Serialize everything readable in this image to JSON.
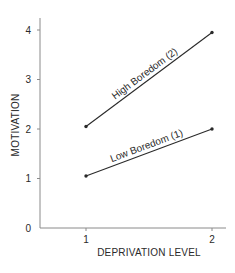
{
  "chart_data": {
    "type": "line",
    "title": "",
    "xlabel": "DEPRIVATION LEVEL",
    "ylabel": "MOTIVATION",
    "x": [
      1,
      2
    ],
    "x_ticks": [
      "1",
      "2"
    ],
    "y_ticks": [
      "0",
      "1",
      "2",
      "3",
      "4"
    ],
    "ylim": [
      0,
      4.2
    ],
    "grid": false,
    "legend": "inline labels along lines",
    "series": [
      {
        "name": "High Boredom (2)",
        "values": [
          2.05,
          3.95
        ]
      },
      {
        "name": "Low Boredom (1)",
        "values": [
          1.05,
          2.0
        ]
      }
    ]
  },
  "colors": {
    "axis": "#8a8a8a",
    "line": "#2a2a2a",
    "text": "#2a2a2a"
  }
}
